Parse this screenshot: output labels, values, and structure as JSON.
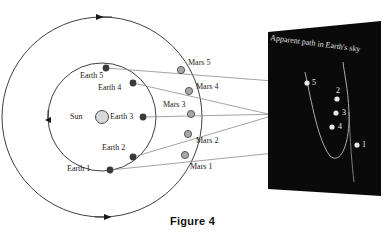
{
  "figure": {
    "caption": "Figure 4",
    "width": 385,
    "height": 240,
    "background": "#ffffff"
  },
  "colors": {
    "orbit_stroke": "#2a2a2a",
    "earth_dot": "#3a3a3a",
    "mars_dot": "#9a9a9a",
    "sun_fill": "#d8d8d8",
    "sight_line": "#6b6b6b",
    "panel_fill": "#0a0a0a",
    "sky_text": "#e8e8e8",
    "label_text": "#1a1a1a",
    "caption_text": "#111111"
  },
  "diagram": {
    "sun": {
      "label": "Sun",
      "cx": 102,
      "cy": 117,
      "r": 6.5,
      "label_x": 70,
      "label_y": 113
    },
    "earth_orbit": {
      "cx": 102,
      "cy": 117,
      "r": 54
    },
    "mars_orbit": {
      "cx": 102,
      "cy": 117,
      "r": 100
    },
    "orbit_direction": "counterclockwise",
    "earth_positions": [
      {
        "label": "Earth 1",
        "x": 110,
        "y": 170,
        "label_x": 67,
        "label_y": 168
      },
      {
        "label": "Earth 2",
        "x": 133,
        "y": 157,
        "label_x": 102,
        "label_y": 147
      },
      {
        "label": "Earth 3",
        "x": 143,
        "y": 117,
        "label_x": 110,
        "label_y": 113
      },
      {
        "label": "Earth 4",
        "x": 133,
        "y": 83,
        "label_x": 98,
        "label_y": 86
      },
      {
        "label": "Earth 5",
        "x": 106,
        "y": 68,
        "label_x": 81,
        "label_y": 75
      }
    ],
    "mars_positions": [
      {
        "label": "Mars 1",
        "x": 185,
        "y": 155,
        "label_x": 190,
        "label_y": 160
      },
      {
        "label": "Mars 2",
        "x": 188,
        "y": 134,
        "label_x": 196,
        "label_y": 137
      },
      {
        "label": "Mars 3",
        "x": 191,
        "y": 114,
        "label_x": 163,
        "label_y": 104
      },
      {
        "label": "Mars 4",
        "x": 189,
        "y": 91,
        "label_x": 196,
        "label_y": 85
      },
      {
        "label": "Mars 5",
        "x": 181,
        "y": 70,
        "label_x": 188,
        "label_y": 61
      }
    ],
    "sight_lines": [
      {
        "name": "sightline-1",
        "x1": 110,
        "y1": 170,
        "x2": 356,
        "y2": 145
      },
      {
        "name": "sightline-2",
        "x1": 133,
        "y1": 157,
        "x2": 333,
        "y2": 99
      },
      {
        "name": "sightline-3",
        "x1": 143,
        "y1": 117,
        "x2": 332,
        "y2": 113
      },
      {
        "name": "sightline-4",
        "x1": 133,
        "y1": 83,
        "x2": 329,
        "y2": 127
      },
      {
        "name": "sightline-5",
        "x1": 106,
        "y1": 68,
        "x2": 303,
        "y2": 83
      }
    ]
  },
  "sky_panel": {
    "title": "Apparent path in Earth's sky",
    "corners": {
      "tl_x": 268,
      "tl_y": 32,
      "tr_x": 381,
      "tr_y": 21,
      "br_x": 381,
      "br_y": 196,
      "bl_x": 268,
      "bl_y": 189
    },
    "points": [
      {
        "label": "5",
        "x": 307,
        "y": 83,
        "label_x": 312,
        "label_y": 79
      },
      {
        "label": "2",
        "x": 337,
        "y": 99,
        "label_x": 337,
        "label_y": 89
      },
      {
        "label": "3",
        "x": 336,
        "y": 113,
        "label_x": 342,
        "label_y": 109
      },
      {
        "label": "4",
        "x": 332,
        "y": 127,
        "label_x": 338,
        "label_y": 123
      },
      {
        "label": "1",
        "x": 357,
        "y": 145,
        "label_x": 362,
        "label_y": 141
      }
    ],
    "path_description": "retrograde loop"
  }
}
